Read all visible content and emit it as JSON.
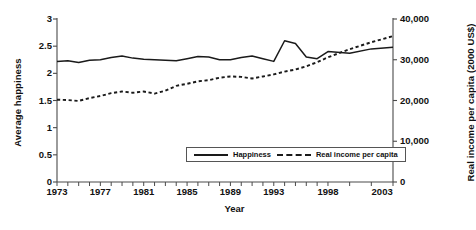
{
  "chart_data": {
    "type": "line",
    "title": "",
    "xlabel": "Year",
    "ylabel": "Average happiness",
    "ylabel_right": "Real income per capita (2000 US$)",
    "grid": false,
    "legend_position": "lower-center",
    "xlim": [
      1973,
      2004
    ],
    "ylim": [
      0,
      3
    ],
    "ylim_right": [
      0,
      40000
    ],
    "x": [
      1973,
      1974,
      1975,
      1976,
      1977,
      1978,
      1979,
      1980,
      1981,
      1982,
      1983,
      1984,
      1985,
      1986,
      1987,
      1988,
      1989,
      1990,
      1991,
      1992,
      1993,
      1994,
      1995,
      1996,
      1997,
      1998,
      2000,
      2002,
      2004
    ],
    "xticks": [
      1973,
      1977,
      1981,
      1985,
      1989,
      1993,
      1998,
      2003
    ],
    "xtick_labels": [
      "1973",
      "1977",
      "1981",
      "1985",
      "1989",
      "1993",
      "1998",
      "2003"
    ],
    "yticks": [
      0,
      0.5,
      1,
      1.5,
      2,
      2.5,
      3
    ],
    "ytick_labels": [
      "0",
      "0.5",
      "1",
      "1.5",
      "2",
      "2.5",
      "3"
    ],
    "yticks_right": [
      0,
      10000,
      20000,
      30000,
      40000
    ],
    "ytick_labels_right": [
      "0",
      "10,000",
      "20,000",
      "30,000",
      "40,000"
    ],
    "series": [
      {
        "name": "Happiness",
        "axis": "left",
        "style": "solid",
        "color": "#1a1a1a",
        "values": [
          2.22,
          2.23,
          2.2,
          2.24,
          2.25,
          2.29,
          2.32,
          2.28,
          2.26,
          2.25,
          2.24,
          2.23,
          2.27,
          2.31,
          2.3,
          2.25,
          2.25,
          2.29,
          2.32,
          2.27,
          2.22,
          2.6,
          2.55,
          2.3,
          2.27,
          2.4,
          2.37,
          2.45,
          2.48
        ]
      },
      {
        "name": "Real income per capita",
        "axis": "right",
        "style": "dashed",
        "color": "#1a1a1a",
        "values": [
          20200,
          20100,
          19900,
          20600,
          21100,
          21800,
          22200,
          21900,
          22200,
          21700,
          22400,
          23600,
          24100,
          24700,
          25000,
          25600,
          25900,
          25800,
          25400,
          25900,
          26400,
          27100,
          27600,
          28400,
          29400,
          30600,
          32600,
          34300,
          35800
        ]
      }
    ]
  },
  "axes": {
    "left_label": "Average happiness",
    "right_label": "Real income per capita (2000 US$)",
    "x_label": "Year"
  },
  "legend": {
    "items": [
      {
        "label": "Happiness",
        "style": "solid"
      },
      {
        "label": "Real income per capita",
        "style": "dashed"
      }
    ]
  }
}
